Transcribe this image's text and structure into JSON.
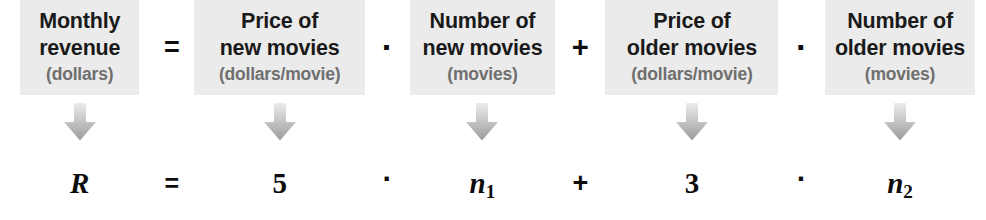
{
  "diagram": {
    "box_fill": "#ebebeb",
    "units_color": "#6f6f6f",
    "text_color": "#1a1a1a",
    "arrow_color_top": "#e4e4e4",
    "arrow_color_bottom": "#9d9d9d",
    "arrow_icon_name": "down-arrow-icon"
  },
  "terms": [
    {
      "id": "monthly-revenue",
      "line1": "Monthly",
      "line2": "revenue",
      "units": "(dollars)",
      "symbol": "R",
      "symbol_sub": ""
    },
    {
      "id": "price-new-movies",
      "line1": "Price of",
      "line2": "new movies",
      "units": "(dollars/movie)",
      "symbol": "5",
      "symbol_sub": ""
    },
    {
      "id": "number-new-movies",
      "line1": "Number of",
      "line2": "new movies",
      "units": "(movies)",
      "symbol": "n",
      "symbol_sub": "1"
    },
    {
      "id": "price-older-movies",
      "line1": "Price of",
      "line2": "older movies",
      "units": "(dollars/movie)",
      "symbol": "3",
      "symbol_sub": ""
    },
    {
      "id": "number-older-movies",
      "line1": "Number of",
      "line2": "older movies",
      "units": "(movies)",
      "symbol": "n",
      "symbol_sub": "2"
    }
  ],
  "operators": [
    {
      "id": "equals",
      "glyph": "="
    },
    {
      "id": "times-1",
      "glyph": "·"
    },
    {
      "id": "plus",
      "glyph": "+"
    },
    {
      "id": "times-2",
      "glyph": "·"
    }
  ],
  "equation": {
    "text": "R = 5 · n₁ + 3 · n₂"
  }
}
